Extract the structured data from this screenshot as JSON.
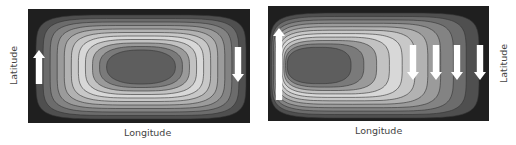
{
  "panels": [
    {
      "id": "symmetric-gyre",
      "xlabel": "Longitude",
      "ylabel": "Latitude",
      "ylabel_side": "left",
      "contour_levels": 11,
      "flow_arrows": [
        {
          "direction": "up",
          "position": "western-edge"
        },
        {
          "direction": "down",
          "position": "eastern-edge"
        }
      ]
    },
    {
      "id": "westward-intensified-gyre",
      "xlabel": "Longitude",
      "ylabel": "Latitude",
      "ylabel_side": "right",
      "contour_levels": 11,
      "flow_arrows": [
        {
          "direction": "up",
          "position": "western-boundary-current"
        },
        {
          "direction": "down",
          "position": "interior-1"
        },
        {
          "direction": "down",
          "position": "interior-2"
        },
        {
          "direction": "down",
          "position": "interior-3"
        },
        {
          "direction": "down",
          "position": "interior-4"
        }
      ]
    }
  ],
  "colors": {
    "background": "#1f1f1f",
    "ring_shades": [
      "#2a2a2a",
      "#4f4f4f",
      "#6c6c6c",
      "#838383",
      "#9b9b9b",
      "#b2b2b2",
      "#c8c8c8",
      "#d8d8d8",
      "#c2c2c2",
      "#9a9a9a",
      "#7a7a7a",
      "#5e5e5e"
    ],
    "contour_line": "#333333",
    "arrow": "#ffffff"
  }
}
